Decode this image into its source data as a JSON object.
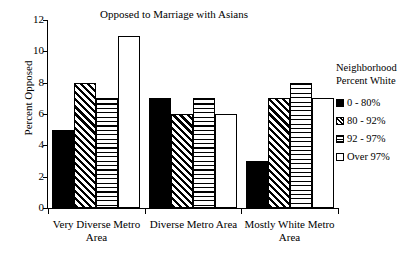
{
  "chart_data": {
    "type": "bar",
    "title": "Opposed to Marriage with Asians",
    "xlabel": "",
    "ylabel": "Percent Opposed",
    "ylim": [
      0,
      12
    ],
    "yticks": [
      0,
      2,
      4,
      6,
      8,
      10,
      12
    ],
    "ytick_labels": [
      "0",
      "2",
      "4",
      "6",
      "8",
      "10",
      "12"
    ],
    "grid": false,
    "legend_position": "right",
    "legend_title": "Neighborhood Percent White",
    "legend_title_lines": [
      "Neighborhood",
      "Percent White"
    ],
    "categories": [
      "Very Diverse Metro Area",
      "Diverse Metro Area",
      "Mostly White Metro Area"
    ],
    "category_label_lines": [
      [
        "Very Diverse Metro",
        "Area"
      ],
      [
        "Diverse Metro Area",
        ""
      ],
      [
        "Mostly White Metro",
        "Area"
      ]
    ],
    "series": [
      {
        "name": "0 - 80%",
        "pattern": "solid",
        "values": [
          5,
          7,
          3
        ]
      },
      {
        "name": "80 - 92%",
        "pattern": "diagonal",
        "values": [
          8,
          6,
          7
        ]
      },
      {
        "name": "92 - 97%",
        "pattern": "horizontal",
        "values": [
          7,
          7,
          8
        ]
      },
      {
        "name": "Over 97%",
        "pattern": "none",
        "values": [
          11,
          6,
          7
        ]
      }
    ]
  },
  "colors": {
    "axis": "#000000",
    "bar_outline": "#000000",
    "background": "#ffffff",
    "ink": "#000000"
  }
}
